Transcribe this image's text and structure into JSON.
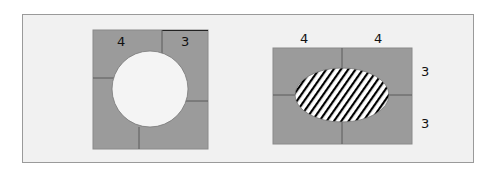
{
  "colors": {
    "background": "#f1f1f1",
    "frame_border": "#9a9a9a",
    "tile_fill": "#9b9b9b",
    "tile_line": "#5a5a5a",
    "hole_fill": "#f4f4f4",
    "hatch_line": "#000000",
    "label": "#111111"
  },
  "figures": [
    {
      "id": "left-square",
      "description": "Square made of tiles with a circular hole in the centre",
      "labels": {
        "top_left": "4",
        "top_right": "3"
      }
    },
    {
      "id": "right-rectangle",
      "description": "Rectangle divided into four tiles with a hatched ellipse in the centre",
      "labels": {
        "top_left": "4",
        "top_right": "4",
        "right_upper": "3",
        "right_lower": "3"
      }
    }
  ]
}
